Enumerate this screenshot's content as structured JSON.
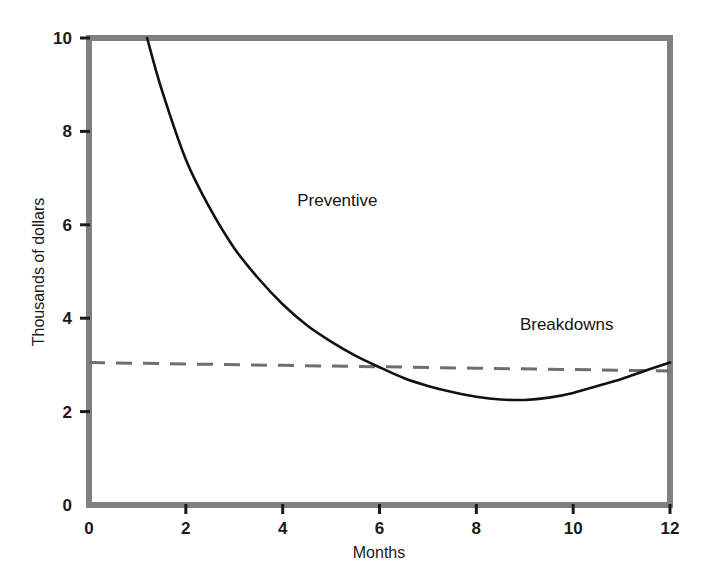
{
  "chart_data": {
    "type": "line",
    "title": "",
    "subtitle": "",
    "xlabel": "Months",
    "ylabel": "Thousands of dollars",
    "xlim": [
      0,
      12
    ],
    "ylim": [
      0,
      10
    ],
    "xticks": [
      "0",
      "2",
      "4",
      "6",
      "8",
      "10",
      "12"
    ],
    "xtick_values": [
      0,
      2,
      4,
      6,
      8,
      10,
      12
    ],
    "yticks": [
      "0",
      "2",
      "4",
      "6",
      "8",
      "10"
    ],
    "ytick_values": [
      0,
      2,
      4,
      6,
      8,
      10
    ],
    "grid": false,
    "legend_position": "inline-annotations",
    "frame": "box",
    "series": [
      {
        "name": "Preventive",
        "style": "solid",
        "color": "#111111",
        "label_position": {
          "x": 4.3,
          "y": 6.4
        },
        "x": [
          1.2,
          1.5,
          2.0,
          2.5,
          3.0,
          3.5,
          4.0,
          4.5,
          5.0,
          5.5,
          6.0,
          6.5,
          7.0,
          7.5,
          8.0,
          8.5,
          9.0,
          9.5,
          10.0,
          10.5,
          11.0,
          11.5,
          12.0
        ],
        "values": [
          10.0,
          8.9,
          7.4,
          6.35,
          5.5,
          4.85,
          4.3,
          3.85,
          3.5,
          3.2,
          2.95,
          2.72,
          2.55,
          2.42,
          2.32,
          2.26,
          2.25,
          2.3,
          2.4,
          2.55,
          2.7,
          2.88,
          3.05
        ]
      },
      {
        "name": "Breakdowns",
        "style": "dashed",
        "color": "#6e6e6e",
        "label_position": {
          "x": 8.9,
          "y": 3.75
        },
        "x": [
          0,
          2,
          4,
          6,
          8,
          10,
          12
        ],
        "values": [
          3.05,
          3.02,
          2.99,
          2.96,
          2.93,
          2.9,
          2.87
        ]
      }
    ],
    "annotations": [
      {
        "text": "Preventive",
        "x": 4.3,
        "y": 6.4
      },
      {
        "text": "Breakdowns",
        "x": 8.9,
        "y": 3.75
      }
    ],
    "crossing_point": {
      "x": 5.8,
      "y": 2.9
    },
    "minimum_point": {
      "series": "Preventive",
      "x": 8.9,
      "y": 2.25
    }
  },
  "colors": {
    "axis": "#808080",
    "preventive_line": "#111111",
    "breakdowns_line": "#6e6e6e",
    "text": "#1a1a1a",
    "background": "#ffffff"
  },
  "axes": {
    "x_title": "Months",
    "y_title": "Thousands of dollars",
    "x_tick_labels": [
      "0",
      "2",
      "4",
      "6",
      "8",
      "10",
      "12"
    ],
    "y_tick_labels": [
      "0",
      "2",
      "4",
      "6",
      "8",
      "10"
    ]
  },
  "labels": {
    "preventive": "Preventive",
    "breakdowns": "Breakdowns"
  }
}
